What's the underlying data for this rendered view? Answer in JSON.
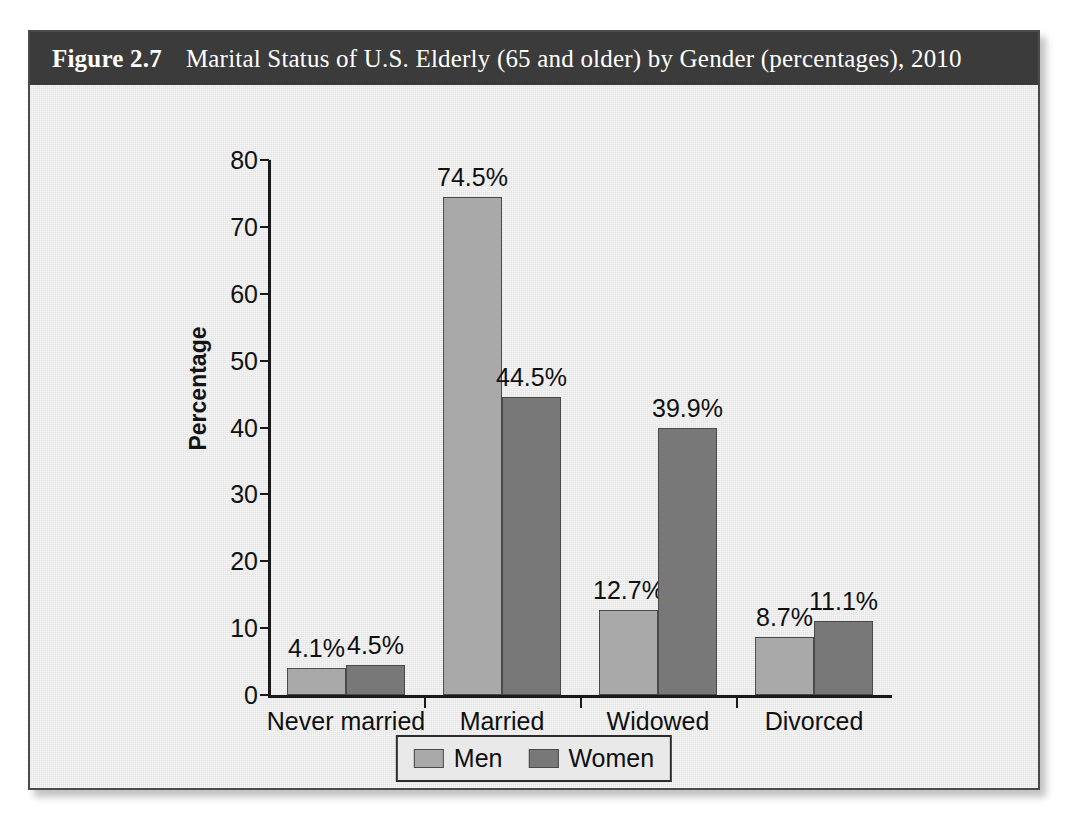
{
  "figure": {
    "number": "Figure 2.7",
    "title": "Marital Status of U.S. Elderly (65 and older) by Gender (percentages), 2010",
    "header_bg": "#3b3b3b",
    "panel_bg": "#e9e9e9"
  },
  "chart_data": {
    "type": "bar",
    "title": "Marital Status of U.S. Elderly (65 and older) by Gender (percentages), 2010",
    "xlabel": "",
    "ylabel": "Percentage",
    "ylim": [
      0,
      80
    ],
    "yticks": [
      "0",
      "10",
      "20",
      "30",
      "40",
      "50",
      "60",
      "70",
      "80"
    ],
    "grid": false,
    "legend_position": "bottom-center",
    "categories": [
      "Never married",
      "Married",
      "Widowed",
      "Divorced"
    ],
    "series": [
      {
        "name": "Men",
        "color": "#a9a9a9",
        "values": [
          4.1,
          74.5,
          12.7,
          8.7
        ],
        "labels": [
          "4.1%",
          "74.5%",
          "12.7%",
          "8.7%"
        ]
      },
      {
        "name": "Women",
        "color": "#787878",
        "values": [
          4.5,
          44.5,
          39.9,
          11.1
        ],
        "labels": [
          "4.5%",
          "44.5%",
          "39.9%",
          "11.1%"
        ]
      }
    ]
  }
}
